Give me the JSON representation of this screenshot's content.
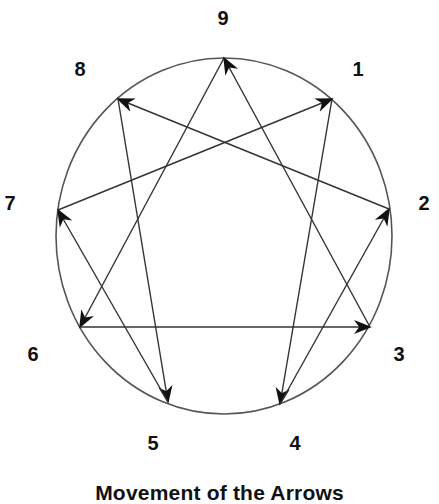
{
  "diagram": {
    "type": "enneagram",
    "circle": {
      "cx": 224,
      "cy": 236,
      "rx": 168,
      "ry": 178,
      "stroke": "#555555"
    },
    "line_color": "#333333",
    "arrowhead_color": "#111111",
    "points": [
      {
        "id": "9",
        "label": "9",
        "x": 224,
        "y": 58,
        "label_x": 223,
        "label_y": 25
      },
      {
        "id": "1",
        "label": "1",
        "x": 332,
        "y": 99,
        "label_x": 358,
        "label_y": 76
      },
      {
        "id": "2",
        "label": "2",
        "x": 389,
        "y": 209,
        "label_x": 424,
        "label_y": 210
      },
      {
        "id": "3",
        "label": "3",
        "x": 370,
        "y": 327,
        "label_x": 399,
        "label_y": 361
      },
      {
        "id": "4",
        "label": "4",
        "x": 280,
        "y": 404,
        "label_x": 295,
        "label_y": 450
      },
      {
        "id": "5",
        "label": "5",
        "x": 168,
        "y": 402,
        "label_x": 153,
        "label_y": 450
      },
      {
        "id": "6",
        "label": "6",
        "x": 80,
        "y": 327,
        "label_x": 33,
        "label_y": 361
      },
      {
        "id": "7",
        "label": "7",
        "x": 58,
        "y": 210,
        "label_x": 10,
        "label_y": 210
      },
      {
        "id": "8",
        "label": "8",
        "x": 118,
        "y": 99,
        "label_x": 80,
        "label_y": 76
      }
    ],
    "arrows": [
      {
        "from": "9",
        "to": "6"
      },
      {
        "from": "6",
        "to": "3"
      },
      {
        "from": "3",
        "to": "9"
      },
      {
        "from": "1",
        "to": "4"
      },
      {
        "from": "4",
        "to": "2"
      },
      {
        "from": "2",
        "to": "8"
      },
      {
        "from": "8",
        "to": "5"
      },
      {
        "from": "5",
        "to": "7"
      },
      {
        "from": "7",
        "to": "1"
      }
    ]
  },
  "caption": "Movement of the Arrows"
}
